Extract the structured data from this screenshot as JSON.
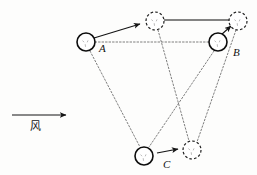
{
  "figure": {
    "kind": "physics-displacement-diagram",
    "background_color": "#fdfdfc",
    "width": 257,
    "height": 175,
    "stroke_color": "#1a1a1a",
    "dotted_color": "#6b6b6b",
    "labels": {
      "a": "A",
      "b": "B",
      "c": "C",
      "wind": "风"
    },
    "nodes": [
      {
        "id": "A",
        "label": "A",
        "style": "solid",
        "cx": 86,
        "cy": 42,
        "r": 9
      },
      {
        "id": "B",
        "label": "B",
        "style": "solid",
        "cx": 218,
        "cy": 42,
        "r": 9
      },
      {
        "id": "C",
        "label": "C",
        "style": "solid",
        "cx": 144,
        "cy": 156,
        "r": 9
      },
      {
        "id": "A2",
        "label": "",
        "style": "dashed",
        "cx": 155,
        "cy": 21,
        "r": 9
      },
      {
        "id": "B2",
        "label": "",
        "style": "dashed",
        "cx": 238,
        "cy": 21,
        "r": 9
      },
      {
        "id": "C2",
        "label": "",
        "style": "dashed",
        "cx": 192,
        "cy": 150,
        "r": 9
      }
    ],
    "displacement_arrows": [
      {
        "from": "A",
        "to": "A2"
      },
      {
        "from": "B",
        "to": "B2"
      },
      {
        "from": "C",
        "to": "C2"
      }
    ],
    "solid_edges": [
      {
        "from": "A2",
        "to": "B2"
      }
    ],
    "dotted_edges": [
      {
        "from": "A",
        "to": "B"
      },
      {
        "from": "A",
        "to": "C"
      },
      {
        "from": "B",
        "to": "C"
      },
      {
        "from": "A2",
        "to": "C2"
      },
      {
        "from": "B2",
        "to": "C2"
      }
    ],
    "wind_arrow": {
      "x1": 12,
      "y1": 115,
      "x2": 68,
      "y2": 115,
      "direction": "right"
    }
  }
}
